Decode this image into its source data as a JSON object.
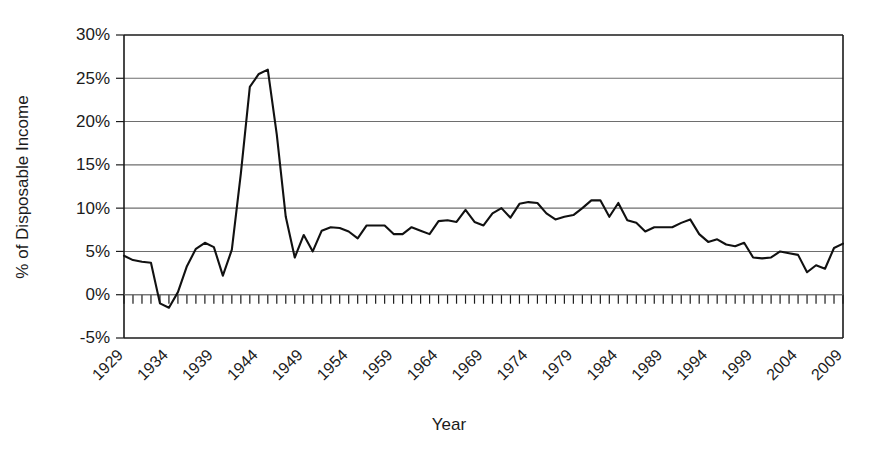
{
  "chart_data": {
    "type": "line",
    "title": "",
    "xlabel": "Year",
    "ylabel": "% of Disposable Income",
    "xlim": [
      1929,
      2009
    ],
    "ylim": [
      -5,
      30
    ],
    "ytick_labels": [
      "30%",
      "25%",
      "20%",
      "15%",
      "10%",
      "5%",
      "0%",
      "-5%"
    ],
    "ytick_values": [
      30,
      25,
      20,
      15,
      10,
      5,
      0,
      -5
    ],
    "ytick_step": 5,
    "xtick_labels": [
      "1929",
      "1934",
      "1939",
      "1944",
      "1949",
      "1954",
      "1959",
      "1964",
      "1969",
      "1974",
      "1979",
      "1984",
      "1989",
      "1994",
      "1999",
      "2004",
      "2009"
    ],
    "xtick_values": [
      1929,
      1934,
      1939,
      1944,
      1949,
      1954,
      1959,
      1964,
      1969,
      1974,
      1979,
      1984,
      1989,
      1994,
      1999,
      2004,
      2009
    ],
    "xtick_label_rotation": -45,
    "minor_xticks_every": 1,
    "grid": "horizontal",
    "legend": "none",
    "line_color": "#111111",
    "grid_color": "#6e6e6e",
    "axis_color": "#1b1b1b",
    "background_color": "#ffffff",
    "series": [
      {
        "name": "Personal saving rate",
        "x": [
          1929,
          1930,
          1931,
          1932,
          1933,
          1934,
          1935,
          1936,
          1937,
          1938,
          1939,
          1940,
          1941,
          1942,
          1943,
          1944,
          1945,
          1946,
          1947,
          1948,
          1949,
          1950,
          1951,
          1952,
          1953,
          1954,
          1955,
          1956,
          1957,
          1958,
          1959,
          1960,
          1961,
          1962,
          1963,
          1964,
          1965,
          1966,
          1967,
          1968,
          1969,
          1970,
          1971,
          1972,
          1973,
          1974,
          1975,
          1976,
          1977,
          1978,
          1979,
          1980,
          1981,
          1982,
          1983,
          1984,
          1985,
          1986,
          1987,
          1988,
          1989,
          1990,
          1991,
          1992,
          1993,
          1994,
          1995,
          1996,
          1997,
          1998,
          1999,
          2000,
          2001,
          2002,
          2003,
          2004,
          2005,
          2006,
          2007,
          2008,
          2009
        ],
        "values": [
          4.5,
          4.0,
          3.8,
          3.7,
          -1.0,
          -1.5,
          0.3,
          3.3,
          5.3,
          6.0,
          5.5,
          2.2,
          5.2,
          14.0,
          24.0,
          25.5,
          26.0,
          18.5,
          9.0,
          4.3,
          6.9,
          5.0,
          7.4,
          7.8,
          7.7,
          7.3,
          6.5,
          8.0,
          8.0,
          8.0,
          7.0,
          7.0,
          7.8,
          7.4,
          7.0,
          8.5,
          8.6,
          8.4,
          9.8,
          8.4,
          8.0,
          9.4,
          10.0,
          8.9,
          10.5,
          10.7,
          10.6,
          9.4,
          8.7,
          9.0,
          9.2,
          10.0,
          10.9,
          10.9,
          9.0,
          10.6,
          8.6,
          8.3,
          7.3,
          7.8,
          7.8,
          7.8,
          8.3,
          8.7,
          7.0,
          6.1,
          6.4,
          5.8,
          5.6,
          6.0,
          4.3,
          4.2,
          4.3,
          5.0,
          4.8,
          4.6,
          2.6,
          3.4,
          3.0,
          5.4,
          5.9
        ]
      }
    ]
  }
}
